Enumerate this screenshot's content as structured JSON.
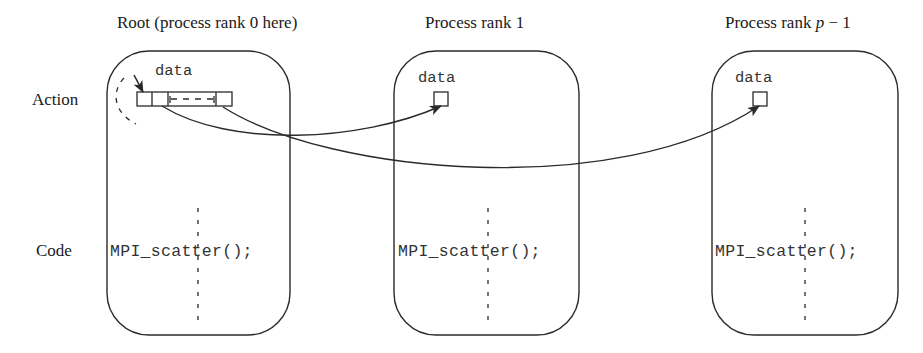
{
  "row_labels": {
    "action": "Action",
    "code": "Code"
  },
  "processes": [
    {
      "title": "Root (process rank 0 here)",
      "data_label": "data",
      "code": "MPI_scatter();"
    },
    {
      "title": "Process rank 1",
      "data_label": "data",
      "code": "MPI_scatter();"
    },
    {
      "title_prefix": "Process rank ",
      "title_var": "p",
      "title_suffix": " − 1",
      "data_label": "data",
      "code": "MPI_scatter();"
    }
  ],
  "colors": {
    "stroke": "#2a2a2a",
    "text": "#1a1a1a"
  }
}
